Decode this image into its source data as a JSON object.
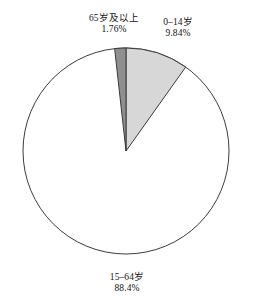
{
  "chart_data": {
    "type": "pie",
    "title": "",
    "subtitle": "",
    "xlabel": "",
    "ylabel": "",
    "legend_position": "none",
    "grid": false,
    "labels_inline": true,
    "start_angle_deg": 0,
    "direction": "clockwise",
    "categories": [
      "0–14岁",
      "15–64岁",
      "65岁及以上"
    ],
    "values": [
      9.84,
      88.4,
      1.76
    ],
    "value_suffix": "%",
    "slices": [
      {
        "name": "0–14岁",
        "value": 9.84,
        "value_text": "9.84%",
        "color": "#d7d7d7",
        "stroke": "#3b3b3b"
      },
      {
        "name": "15–64岁",
        "value": 88.4,
        "value_text": "88.4%",
        "color": "#ffffff",
        "stroke": "#3b3b3b"
      },
      {
        "name": "65岁及以上",
        "value": 1.76,
        "value_text": "1.76%",
        "color": "#8f8f8f",
        "stroke": "#3b3b3b"
      }
    ]
  },
  "labels": {
    "senior": {
      "name": "65岁及以上",
      "value": "1.76%"
    },
    "children": {
      "name": "0–14岁",
      "value": "9.84%"
    },
    "working": {
      "name": "15–64岁",
      "value": "88.4%"
    }
  },
  "colors": {
    "children_slice": "#d7d7d7",
    "working_slice": "#ffffff",
    "senior_slice": "#8f8f8f",
    "outline": "#3b3b3b",
    "text": "#131313",
    "background": "#ffffff"
  }
}
